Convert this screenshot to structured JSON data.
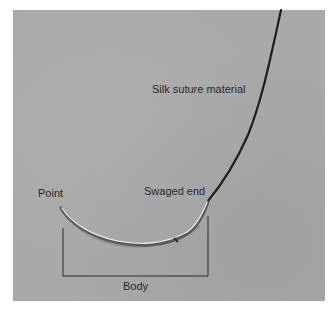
{
  "figure": {
    "background_color": "#a9a9a9",
    "labels": {
      "suture": "Silk suture material",
      "swaged_end": "Swaged end",
      "point": "Point",
      "body": "Body"
    },
    "colors": {
      "suture": "#1e1e1e",
      "needle": "#d9d9d9",
      "needle_shadow": "#6e6e6e",
      "bracket": "#2a2a2a",
      "label_text": "#2a2a2a"
    }
  }
}
